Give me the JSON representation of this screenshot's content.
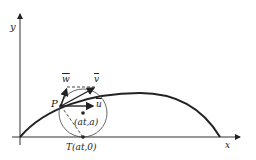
{
  "diagram": {
    "axes": {
      "x_label": "x",
      "y_label": "y"
    },
    "labels": {
      "point_p": "P",
      "vector_w": "w",
      "vector_v": "v",
      "vector_u": "u",
      "center": "(at,a)",
      "tangent_point": "T(at,0)"
    },
    "colors": {
      "ink": "#222222",
      "background": "#ffffff"
    }
  }
}
